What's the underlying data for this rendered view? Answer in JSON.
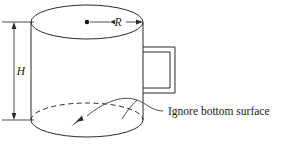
{
  "figure": {
    "type": "engineering-diagram",
    "background_color": "#ffffff",
    "line_color": "#2b2b2b",
    "canvas": {
      "width": 282,
      "height": 150
    }
  },
  "labels": {
    "height_symbol": "H",
    "radius_symbol": "R",
    "annotation": "Ignore bottom surface"
  },
  "geometry": {
    "top_ellipse": {
      "cx": 87,
      "cy": 22,
      "rx": 56,
      "ry": 17
    },
    "bottom_ellipse": {
      "cx": 87,
      "cy": 120,
      "rx": 56,
      "ry": 17
    },
    "left_wall_x": 31,
    "right_wall_x": 143,
    "body_top_y": 22,
    "body_bottom_y": 120,
    "center_dot": {
      "cx": 87,
      "cy": 22,
      "r": 2.2
    },
    "handle": {
      "outer": {
        "x": 143,
        "y": 47,
        "width": 32,
        "height": 46
      },
      "inner": {
        "x": 148,
        "y": 52,
        "width": 22,
        "height": 36
      }
    },
    "dimension_line_x": 14,
    "extension_line_left_x": 2,
    "extension_line_right_x": 34
  },
  "annotation_leader": {
    "text_anchor_x": 168,
    "text_anchor_y": 111,
    "arrow_tip_x": 71,
    "arrow_tip_y": 127
  }
}
